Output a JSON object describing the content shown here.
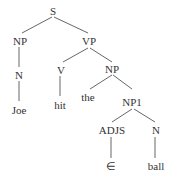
{
  "diagram": {
    "type": "syntax-tree",
    "nodes": {
      "s": "S",
      "np": "NP",
      "vp": "VP",
      "n1": "N",
      "v": "V",
      "np2": "NP",
      "joe": "Joe",
      "hit": "hit",
      "the": "the",
      "np1": "NP1",
      "adjs": "ADJS",
      "n2": "N",
      "epsilon": "∈",
      "ball": "ball"
    },
    "edges": [
      [
        "S",
        "NP"
      ],
      [
        "S",
        "VP"
      ],
      [
        "NP",
        "N"
      ],
      [
        "N",
        "Joe"
      ],
      [
        "VP",
        "V"
      ],
      [
        "VP",
        "NP"
      ],
      [
        "V",
        "hit"
      ],
      [
        "NP",
        "the"
      ],
      [
        "NP",
        "NP1"
      ],
      [
        "NP1",
        "ADJS"
      ],
      [
        "NP1",
        "N"
      ],
      [
        "ADJS",
        "∈"
      ],
      [
        "N",
        "ball"
      ]
    ],
    "colors": {
      "text": "#333333",
      "lines": "#555555",
      "background": "#ffffff"
    }
  }
}
